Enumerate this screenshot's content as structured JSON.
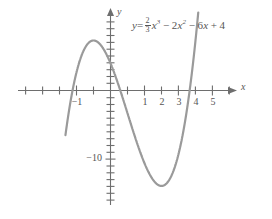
{
  "chart_data": {
    "type": "line",
    "title": "",
    "equation_text": "y = (2/3)x^3 - 2x^2 - 6x + 4",
    "equation_parts": {
      "lhs": "y",
      "equals": "=",
      "frac_num": "2",
      "frac_den": "3",
      "term1_var": "x",
      "term1_exp": "3",
      "op1": "−",
      "term2_coef": "2",
      "term2_var": "x",
      "term2_exp": "2",
      "op2": "−",
      "term3_coef": "6",
      "term3_var": "x",
      "op3": "+",
      "constant": "4"
    },
    "xlabel": "x",
    "ylabel": "y",
    "xlim": [
      -2.65,
      5.75
    ],
    "ylim": [
      -17.5,
      11.5
    ],
    "grid": false,
    "legend": null,
    "x_tick_labels": [
      {
        "value": -1,
        "label": "−1"
      },
      {
        "value": 1,
        "label": "1"
      },
      {
        "value": 2,
        "label": "2"
      },
      {
        "value": 3,
        "label": "3"
      },
      {
        "value": 4,
        "label": "4"
      },
      {
        "value": 5,
        "label": "5"
      }
    ],
    "x_minor_ticks": [
      -2.5,
      -2,
      -1.5,
      -1,
      -0.5,
      0.5,
      1,
      1.5,
      2,
      2.5,
      3,
      3.5,
      4,
      4.5,
      5
    ],
    "y_tick_labels": [
      {
        "value": -10,
        "label": "−10"
      }
    ],
    "y_minor_ticks": [
      -17,
      -16,
      -15,
      -14,
      -13,
      -12,
      -11,
      -10,
      -9,
      -8,
      -7,
      -6,
      -5,
      -4,
      -3,
      -2,
      -1,
      1,
      2,
      3,
      4,
      5,
      6,
      7,
      8,
      9,
      10
    ],
    "series": [
      {
        "name": "y = (2/3)x^3 - 2x^2 - 6x + 4",
        "color": "#9a9a9a",
        "linewidth": 2.1,
        "x": [
          -2.65,
          -2.5,
          -2.35,
          -2.2,
          -2.05,
          -1.9,
          -1.75,
          -1.6,
          -1.45,
          -1.3,
          -1.15,
          -1.0,
          -0.85,
          -0.7,
          -0.55,
          -0.4,
          -0.25,
          -0.1,
          0.05,
          0.2,
          0.35,
          0.5,
          0.65,
          0.8,
          0.95,
          1.1,
          1.25,
          1.4,
          1.55,
          1.7,
          1.85,
          2.0,
          2.15,
          2.3,
          2.45,
          2.6,
          2.75,
          2.9,
          3.05,
          3.2,
          3.35,
          3.5,
          3.65,
          3.8,
          3.95,
          4.1,
          4.25,
          4.4,
          4.55,
          4.7,
          4.85,
          5.0,
          5.1
        ],
        "y": [
          -16.9,
          -12.92,
          -9.3,
          -6.03,
          -3.09,
          -0.49,
          1.81,
          3.81,
          5.52,
          6.96,
          8.15,
          9.11,
          9.84,
          10.36,
          10.69,
          10.85,
          10.84,
          10.69,
          10.4,
          10.0,
          9.5,
          8.92,
          8.27,
          7.57,
          6.83,
          6.08,
          5.32,
          4.57,
          3.85,
          3.18,
          2.57,
          2.04,
          1.6,
          1.27,
          1.07,
          1.0,
          1.09,
          1.36,
          1.81,
          2.47,
          3.35,
          4.46,
          5.82,
          7.45,
          9.36,
          11.57,
          14.09,
          16.94,
          20.13,
          23.68,
          27.61,
          31.93,
          34.92
        ],
        "note": "values below are actual function values; see y_actual for the plotted polynomial"
      }
    ],
    "function": {
      "expression": "y = (2/3)x^3 - 2x^2 - 6x + 4",
      "coefficients": {
        "x3": 0.6667,
        "x2": -2,
        "x1": -6,
        "x0": 4
      },
      "local_max": {
        "x": -1.0,
        "y": 7.33
      },
      "local_min": {
        "x": 3.0,
        "y": -14.0
      },
      "y_intercept": {
        "x": 0,
        "y": 4
      },
      "x_intercepts": [
        -2.27,
        0.6,
        4.67
      ]
    },
    "axis_color": "#6e6e6e",
    "curve_color": "#9a9a9a",
    "background": "#ffffff"
  },
  "labels": {
    "x_axis": "x",
    "y_axis": "y",
    "y_tick_minus_ten": "−10",
    "x_tick_minus_one": "−1",
    "x_tick_one": "1",
    "x_tick_two": "2",
    "x_tick_three": "3",
    "x_tick_four": "4",
    "x_tick_five": "5"
  }
}
